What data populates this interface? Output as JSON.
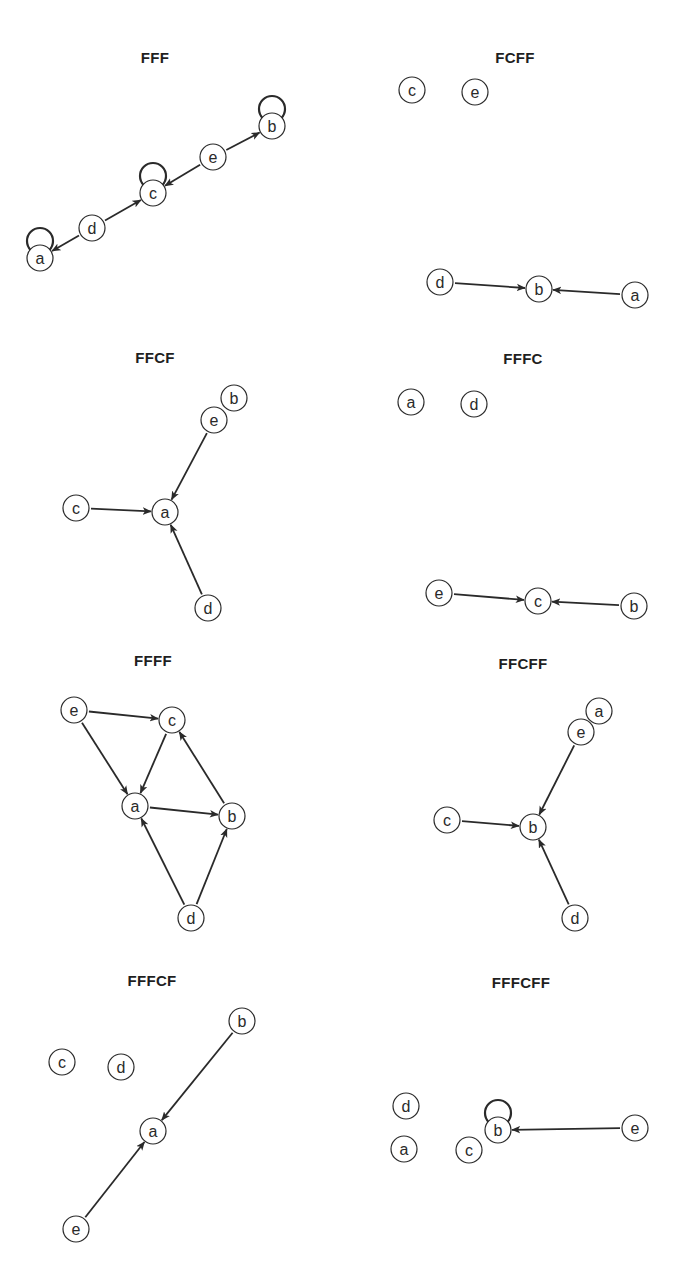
{
  "figure": {
    "node_radius": 13,
    "stroke_color": "#2a2a2a",
    "node_fill": "#ffffff",
    "caption": "",
    "panels": [
      {
        "title": "FFF",
        "title_pos": [
          155,
          57
        ],
        "nodes": [
          {
            "id": "a",
            "x": 40,
            "y": 258,
            "self_loop": true
          },
          {
            "id": "d",
            "x": 92,
            "y": 228,
            "self_loop": false
          },
          {
            "id": "c",
            "x": 153,
            "y": 193,
            "self_loop": true
          },
          {
            "id": "e",
            "x": 213,
            "y": 157,
            "self_loop": false
          },
          {
            "id": "b",
            "x": 272,
            "y": 126,
            "self_loop": true
          }
        ],
        "edges": [
          {
            "from": "d",
            "to": "a"
          },
          {
            "from": "d",
            "to": "c"
          },
          {
            "from": "e",
            "to": "c"
          },
          {
            "from": "e",
            "to": "b"
          }
        ]
      },
      {
        "title": "FCFF",
        "title_pos": [
          515,
          57
        ],
        "nodes": [
          {
            "id": "c",
            "x": 412,
            "y": 90,
            "self_loop": false
          },
          {
            "id": "e",
            "x": 475,
            "y": 92,
            "self_loop": false
          },
          {
            "id": "d",
            "x": 440,
            "y": 282,
            "self_loop": false
          },
          {
            "id": "b",
            "x": 539,
            "y": 289,
            "self_loop": false
          },
          {
            "id": "a",
            "x": 635,
            "y": 295,
            "self_loop": false
          }
        ],
        "edges": [
          {
            "from": "d",
            "to": "b"
          },
          {
            "from": "a",
            "to": "b"
          }
        ]
      },
      {
        "title": "FFCF",
        "title_pos": [
          155,
          357
        ],
        "nodes": [
          {
            "id": "b",
            "x": 234,
            "y": 398,
            "self_loop": false
          },
          {
            "id": "e",
            "x": 214,
            "y": 420,
            "self_loop": false
          },
          {
            "id": "c",
            "x": 76,
            "y": 508,
            "self_loop": false
          },
          {
            "id": "a",
            "x": 165,
            "y": 512,
            "self_loop": false
          },
          {
            "id": "d",
            "x": 208,
            "y": 608,
            "self_loop": false
          }
        ],
        "edges": [
          {
            "from": "e",
            "to": "a"
          },
          {
            "from": "c",
            "to": "a"
          },
          {
            "from": "d",
            "to": "a"
          }
        ]
      },
      {
        "title": "FFFC",
        "title_pos": [
          523,
          358
        ],
        "nodes": [
          {
            "id": "a",
            "x": 411,
            "y": 402,
            "self_loop": false
          },
          {
            "id": "d",
            "x": 474,
            "y": 404,
            "self_loop": false
          },
          {
            "id": "e",
            "x": 439,
            "y": 593,
            "self_loop": false
          },
          {
            "id": "c",
            "x": 538,
            "y": 601,
            "self_loop": false
          },
          {
            "id": "b",
            "x": 634,
            "y": 606,
            "self_loop": false
          }
        ],
        "edges": [
          {
            "from": "e",
            "to": "c"
          },
          {
            "from": "b",
            "to": "c"
          }
        ]
      },
      {
        "title": "FFFF",
        "title_pos": [
          153,
          660
        ],
        "nodes": [
          {
            "id": "e",
            "x": 74,
            "y": 710,
            "self_loop": false
          },
          {
            "id": "c",
            "x": 172,
            "y": 720,
            "self_loop": false
          },
          {
            "id": "a",
            "x": 135,
            "y": 806,
            "self_loop": false
          },
          {
            "id": "b",
            "x": 232,
            "y": 816,
            "self_loop": false
          },
          {
            "id": "d",
            "x": 191,
            "y": 918,
            "self_loop": false
          }
        ],
        "edges": [
          {
            "from": "e",
            "to": "c"
          },
          {
            "from": "e",
            "to": "a"
          },
          {
            "from": "c",
            "to": "a"
          },
          {
            "from": "a",
            "to": "b"
          },
          {
            "from": "b",
            "to": "c"
          },
          {
            "from": "d",
            "to": "a"
          },
          {
            "from": "d",
            "to": "b"
          }
        ]
      },
      {
        "title": "FFCFF",
        "title_pos": [
          523,
          663
        ],
        "nodes": [
          {
            "id": "a",
            "x": 599,
            "y": 711,
            "self_loop": false
          },
          {
            "id": "e",
            "x": 581,
            "y": 732,
            "self_loop": false
          },
          {
            "id": "c",
            "x": 447,
            "y": 820,
            "self_loop": false
          },
          {
            "id": "b",
            "x": 533,
            "y": 827,
            "self_loop": false
          },
          {
            "id": "d",
            "x": 575,
            "y": 918,
            "self_loop": false
          }
        ],
        "edges": [
          {
            "from": "e",
            "to": "b"
          },
          {
            "from": "c",
            "to": "b"
          },
          {
            "from": "d",
            "to": "b"
          }
        ]
      },
      {
        "title": "FFFCF",
        "title_pos": [
          152,
          980
        ],
        "nodes": [
          {
            "id": "b",
            "x": 242,
            "y": 1021,
            "self_loop": false
          },
          {
            "id": "c",
            "x": 62,
            "y": 1062,
            "self_loop": false
          },
          {
            "id": "d",
            "x": 121,
            "y": 1067,
            "self_loop": false
          },
          {
            "id": "a",
            "x": 153,
            "y": 1131,
            "self_loop": false
          },
          {
            "id": "e",
            "x": 76,
            "y": 1229,
            "self_loop": false
          }
        ],
        "edges": [
          {
            "from": "b",
            "to": "a"
          },
          {
            "from": "e",
            "to": "a"
          }
        ]
      },
      {
        "title": "FFFCFF",
        "title_pos": [
          521,
          982
        ],
        "nodes": [
          {
            "id": "d",
            "x": 406,
            "y": 1106,
            "self_loop": false
          },
          {
            "id": "b",
            "x": 498,
            "y": 1130,
            "self_loop": true
          },
          {
            "id": "e",
            "x": 635,
            "y": 1128,
            "self_loop": false
          },
          {
            "id": "a",
            "x": 404,
            "y": 1149,
            "self_loop": false
          },
          {
            "id": "c",
            "x": 469,
            "y": 1150,
            "self_loop": false
          }
        ],
        "edges": [
          {
            "from": "e",
            "to": "b"
          }
        ]
      }
    ]
  }
}
